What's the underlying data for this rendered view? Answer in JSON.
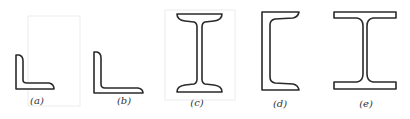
{
  "figure": {
    "shapes": [
      {
        "id": "a",
        "label": "(a)",
        "type": "equal-leg angle"
      },
      {
        "id": "b",
        "label": "(b)",
        "type": "unequal-leg angle"
      },
      {
        "id": "c",
        "label": "(c)",
        "type": "I-beam (tapered flange)"
      },
      {
        "id": "d",
        "label": "(d)",
        "type": "channel"
      },
      {
        "id": "e",
        "label": "(e)",
        "type": "wide-flange H-beam"
      }
    ],
    "colors": {
      "stroke": "#2a2a2a",
      "background": "#ffffff"
    }
  }
}
